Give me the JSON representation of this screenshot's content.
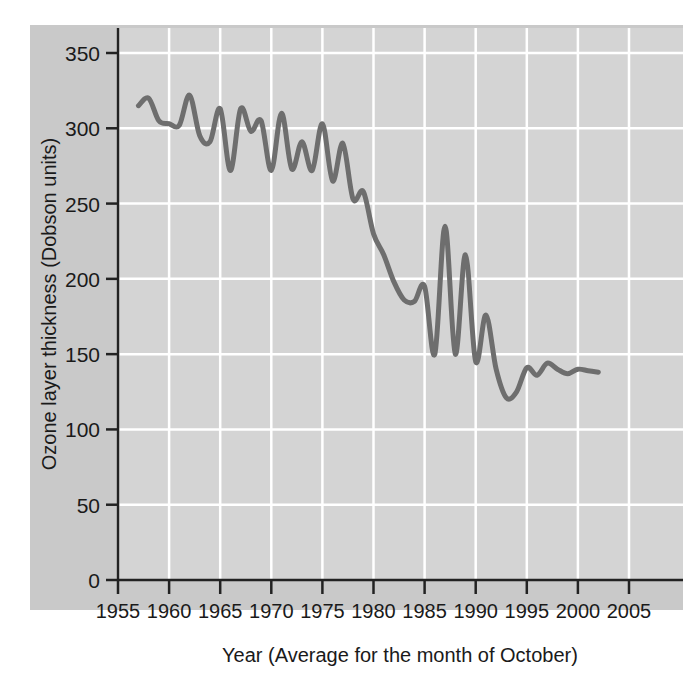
{
  "chart_data": {
    "type": "line",
    "title": "",
    "xlabel": "Year (Average for the month of October)",
    "ylabel": "Ozone layer thickness (Dobson units)",
    "xlim": [
      1955,
      2005
    ],
    "ylim": [
      0,
      365
    ],
    "xticks": [
      1955,
      1960,
      1965,
      1970,
      1975,
      1980,
      1985,
      1990,
      1995,
      2000,
      2005
    ],
    "yticks": [
      0,
      50,
      100,
      150,
      200,
      250,
      300,
      350
    ],
    "xtick_labels": [
      "1955",
      "1960",
      "1965",
      "1970",
      "1975",
      "1980",
      "1985",
      "1990",
      "1995",
      "2000",
      "2005"
    ],
    "ytick_labels": [
      "0",
      "50",
      "100",
      "150",
      "200",
      "250",
      "300",
      "350"
    ],
    "grid": true,
    "grid_color": "#ffffff",
    "legend": null,
    "line_color": "#6e6e6e",
    "line_width": 5,
    "plot_background": "#d4d4d4",
    "margin_background": "#c9c9c9",
    "axis_color": "#222222",
    "x": [
      1957,
      1958,
      1959,
      1960,
      1961,
      1962,
      1963,
      1964,
      1965,
      1966,
      1967,
      1968,
      1969,
      1970,
      1971,
      1972,
      1973,
      1974,
      1975,
      1976,
      1977,
      1978,
      1979,
      1980,
      1981,
      1982,
      1983,
      1984,
      1985,
      1986,
      1987,
      1988,
      1989,
      1990,
      1991,
      1992,
      1993,
      1994,
      1995,
      1996,
      1997,
      1998,
      1999,
      2000,
      2001,
      2002
    ],
    "values": [
      315,
      320,
      305,
      303,
      302,
      322,
      295,
      291,
      313,
      272,
      313,
      298,
      305,
      272,
      310,
      273,
      291,
      272,
      303,
      265,
      290,
      253,
      258,
      230,
      216,
      198,
      186,
      185,
      195,
      150,
      235,
      150,
      216,
      145,
      176,
      140,
      121,
      125,
      141,
      136,
      144,
      140,
      137,
      140,
      139,
      138
    ]
  },
  "axes": {
    "y_title": "Ozone layer thickness (Dobson units)",
    "x_title": "Year (Average for the month of October)"
  }
}
